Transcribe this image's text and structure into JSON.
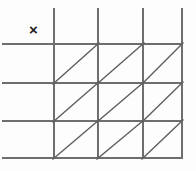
{
  "figure": {
    "kind": "grid-with-diagonals",
    "background_color": "#fdfdfd",
    "line_color": "#6e6e6e",
    "diagonal_color": "#5f5f5f",
    "mark_color": "#1d1d1d",
    "canvas": {
      "width": 196,
      "height": 171
    },
    "vertical_lines": [
      {
        "name": "vertical-line-1",
        "x": 54,
        "y1": 8,
        "y2": 159
      },
      {
        "name": "vertical-line-2",
        "x": 98,
        "y1": 8,
        "y2": 159
      },
      {
        "name": "vertical-line-3",
        "x": 143,
        "y1": 8,
        "y2": 159
      },
      {
        "name": "vertical-line-4",
        "x": 182,
        "y1": 8,
        "y2": 159
      }
    ],
    "horizontal_lines": [
      {
        "name": "horizontal-line-1",
        "y": 44,
        "x1": 2,
        "x2": 183
      },
      {
        "name": "horizontal-line-2",
        "y": 83,
        "x1": 2,
        "x2": 183
      },
      {
        "name": "horizontal-line-3",
        "y": 121,
        "x1": 2,
        "x2": 183
      },
      {
        "name": "horizontal-line-4",
        "y": 158,
        "x1": 2,
        "x2": 183
      }
    ],
    "diagonals": [
      {
        "name": "diagonal-r1c1",
        "x1": 53,
        "y1": 84,
        "x2": 99,
        "y2": 43
      },
      {
        "name": "diagonal-r1c2",
        "x1": 97,
        "y1": 84,
        "x2": 144,
        "y2": 43
      },
      {
        "name": "diagonal-r1c3",
        "x1": 142,
        "y1": 84,
        "x2": 183,
        "y2": 43
      },
      {
        "name": "diagonal-r2c1",
        "x1": 53,
        "y1": 122,
        "x2": 99,
        "y2": 82
      },
      {
        "name": "diagonal-r2c2",
        "x1": 97,
        "y1": 122,
        "x2": 144,
        "y2": 82
      },
      {
        "name": "diagonal-r2c3",
        "x1": 142,
        "y1": 122,
        "x2": 183,
        "y2": 82
      },
      {
        "name": "diagonal-r3c1",
        "x1": 53,
        "y1": 159,
        "x2": 99,
        "y2": 120
      },
      {
        "name": "diagonal-r3c2",
        "x1": 97,
        "y1": 159,
        "x2": 144,
        "y2": 120
      },
      {
        "name": "diagonal-r3c3",
        "x1": 142,
        "y1": 159,
        "x2": 183,
        "y2": 120
      }
    ],
    "marks": [
      {
        "name": "x-mark",
        "label": "×",
        "x": 29,
        "y": 22
      }
    ]
  }
}
